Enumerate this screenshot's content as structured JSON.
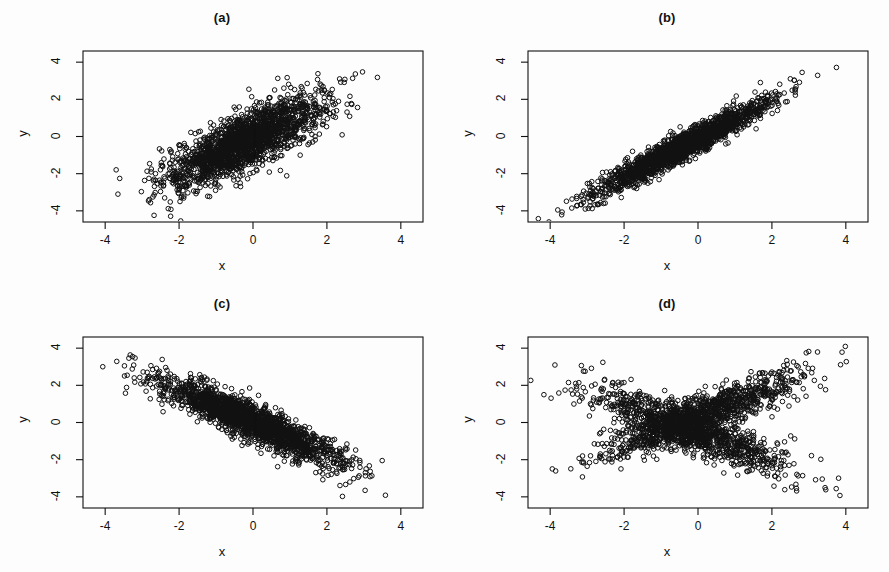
{
  "figure": {
    "background_color": "#fdfdfd",
    "ink_color": "#111111",
    "width": 889,
    "height": 572,
    "panel_count": 4
  },
  "panels": [
    {
      "id": "a",
      "title": "(a)",
      "xlabel": "x",
      "ylabel": "y"
    },
    {
      "id": "b",
      "title": "(b)",
      "xlabel": "x",
      "ylabel": "y"
    },
    {
      "id": "c",
      "title": "(c)",
      "xlabel": "x",
      "ylabel": "y"
    },
    {
      "id": "d",
      "title": "(d)",
      "xlabel": "x",
      "ylabel": "y"
    }
  ],
  "axis": {
    "x_ticks": [
      "-4",
      "-2",
      "0",
      "2",
      "4"
    ],
    "y_ticks": [
      "-4",
      "-2",
      "0",
      "2",
      "4"
    ],
    "x_tick_values": [
      -4,
      -2,
      0,
      2,
      4
    ],
    "y_tick_values": [
      -4,
      -2,
      0,
      2,
      4
    ]
  },
  "chart_data": [
    {
      "type": "scatter",
      "panel": "a",
      "title": "(a)",
      "xlabel": "x",
      "ylabel": "y",
      "xlim": [
        -4.6,
        4.6
      ],
      "ylim": [
        -4.6,
        4.6
      ],
      "x_ticks": [
        -4,
        -2,
        0,
        2,
        4
      ],
      "y_ticks": [
        -4,
        -2,
        0,
        2,
        4
      ],
      "grid": false,
      "legend": "none",
      "marker": "open-circle",
      "marker_size": 4.6,
      "n_points": 2000,
      "description": "Moderate positive linear association; elliptical cloud tilted upward, fanning wider at low x.",
      "generator": {
        "model": "bivariate-normal",
        "components": [
          {
            "weight": 1.0,
            "mean_x": -0.25,
            "mean_y": -0.3,
            "sd_x": 1.05,
            "sd_y": 1.2,
            "rho": 0.78
          }
        ],
        "seed": 11
      }
    },
    {
      "type": "scatter",
      "panel": "b",
      "title": "(b)",
      "xlabel": "x",
      "ylabel": "y",
      "xlim": [
        -4.6,
        4.6
      ],
      "ylim": [
        -4.6,
        4.6
      ],
      "x_ticks": [
        -4,
        -2,
        0,
        2,
        4
      ],
      "y_ticks": [
        -4,
        -2,
        0,
        2,
        4
      ],
      "grid": false,
      "legend": "none",
      "marker": "open-circle",
      "marker_size": 4.6,
      "n_points": 2000,
      "description": "Strong positive linear association; narrow tight band along the rising diagonal.",
      "generator": {
        "model": "bivariate-normal",
        "components": [
          {
            "weight": 1.0,
            "mean_x": -0.4,
            "mean_y": -0.55,
            "sd_x": 1.15,
            "sd_y": 1.25,
            "rho": 0.955
          }
        ],
        "seed": 23
      }
    },
    {
      "type": "scatter",
      "panel": "c",
      "title": "(c)",
      "xlabel": "x",
      "ylabel": "y",
      "xlim": [
        -4.6,
        4.6
      ],
      "ylim": [
        -4.6,
        4.6
      ],
      "x_ticks": [
        -4,
        -2,
        0,
        2,
        4
      ],
      "y_ticks": [
        -4,
        -2,
        0,
        2,
        4
      ],
      "grid": false,
      "legend": "none",
      "marker": "open-circle",
      "marker_size": 4.6,
      "n_points": 2000,
      "description": "Strong negative linear association; dense band descending from upper-left to lower-right.",
      "generator": {
        "model": "bivariate-normal",
        "components": [
          {
            "weight": 1.0,
            "mean_x": -0.1,
            "mean_y": 0.1,
            "sd_x": 1.2,
            "sd_y": 1.15,
            "rho": -0.9
          }
        ],
        "seed": 37
      }
    },
    {
      "type": "scatter",
      "panel": "d",
      "title": "(d)",
      "xlabel": "x",
      "ylabel": "y",
      "xlim": [
        -4.6,
        4.6
      ],
      "ylim": [
        -4.6,
        4.6
      ],
      "x_ticks": [
        -4,
        -2,
        0,
        2,
        4
      ],
      "y_ticks": [
        -4,
        -2,
        0,
        2,
        4
      ],
      "grid": false,
      "legend": "none",
      "marker": "open-circle",
      "marker_size": 4.6,
      "n_points": 2200,
      "description": "Mixture of a positive-slope and a negative-slope component producing an X / bow-tie crossing pattern with near-zero overall correlation.",
      "generator": {
        "model": "gaussian-mixture",
        "components": [
          {
            "weight": 0.5,
            "mean_x": 0.0,
            "mean_y": 0.35,
            "sd_x": 1.35,
            "sd_y": 1.15,
            "rho": 0.87
          },
          {
            "weight": 0.5,
            "mean_x": -0.15,
            "mean_y": -0.45,
            "sd_x": 1.35,
            "sd_y": 1.1,
            "rho": -0.85
          }
        ],
        "seed": 53
      }
    }
  ]
}
